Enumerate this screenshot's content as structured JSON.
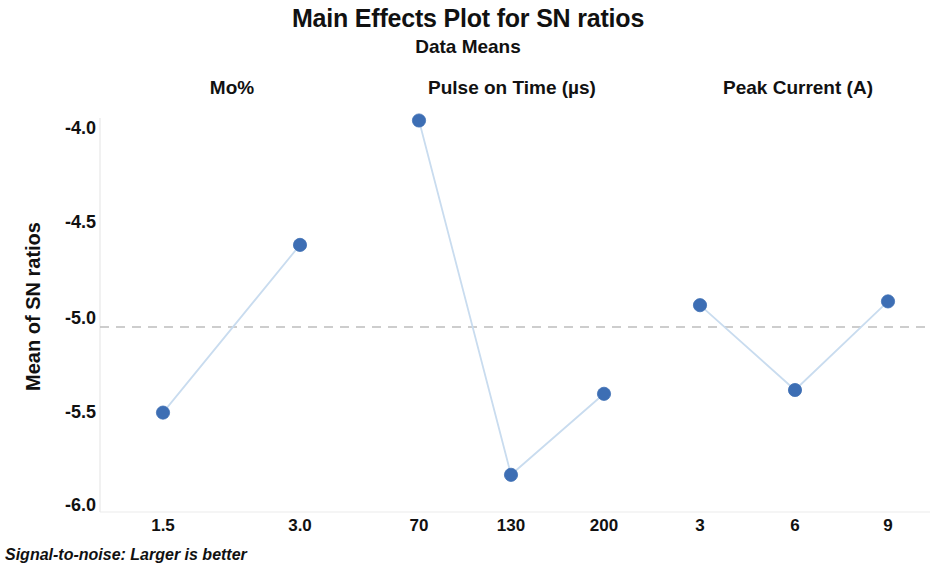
{
  "chart_data": {
    "type": "line",
    "title": "Main Effects Plot for SN ratios",
    "subtitle": "Data Means",
    "ylabel": "Mean of SN ratios",
    "xlabel": "",
    "footnote": "Signal-to-noise: Larger is better",
    "ylim": [
      -6.0,
      -4.0
    ],
    "y_ticks": [
      -4.0,
      -4.5,
      -5.0,
      -5.5,
      -6.0
    ],
    "y_tick_labels": [
      "-4.0",
      "-4.5",
      "-5.0",
      "-5.5",
      "-6.0"
    ],
    "grid": false,
    "legend": "none",
    "marker_color": "#3d6eb4",
    "line_color": "#c9dcef",
    "reference_line": {
      "value": -5.05,
      "style": "dashed",
      "color": "#bdbdbd",
      "label": "overall mean"
    },
    "panels": [
      {
        "name": "Mo%",
        "categories": [
          "1.5",
          "3.0"
        ],
        "values": [
          -5.51,
          -4.62
        ]
      },
      {
        "name": "Pulse on Time (µs)",
        "categories": [
          "70",
          "130",
          "200"
        ],
        "values": [
          -3.96,
          -5.84,
          -5.41
        ]
      },
      {
        "name": "Peak Current (A)",
        "categories": [
          "3",
          "6",
          "9"
        ],
        "values": [
          -4.94,
          -5.39,
          -4.92
        ]
      }
    ]
  },
  "layout": {
    "y_tick_pixels": [
      128,
      222,
      318,
      412,
      505
    ],
    "panel_header_x": [
      232,
      512,
      798
    ],
    "point_x": [
      [
        163,
        300
      ],
      [
        419,
        511,
        604
      ],
      [
        700,
        795,
        888
      ]
    ],
    "point_y": [
      [
        412,
        244
      ],
      [
        121,
        475,
        391
      ],
      [
        305,
        390,
        301
      ]
    ],
    "reference_line_y": 327,
    "reference_line_x": [
      100,
      930
    ]
  }
}
